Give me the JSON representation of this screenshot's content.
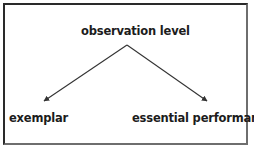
{
  "figure": {
    "background_color": "#ffffff",
    "frame_color_dark": "#2a2a2a",
    "frame_color_light": "#6e6e6e",
    "stroke_color": "#333333",
    "text_color": "#1c1c1c"
  },
  "nodes": {
    "root": {
      "label": "observation level"
    },
    "left_child": {
      "label": "exemplar"
    },
    "right_child": {
      "label": "essential performance"
    }
  },
  "edges": [
    {
      "name": "observation-level-to-exemplar",
      "from": "observation level",
      "to": "exemplar",
      "style": "solid",
      "arrowhead": "filled-triangle",
      "x1": 127,
      "y1": 45,
      "x2": 41,
      "y2": 103
    },
    {
      "name": "observation-level-to-essential-performance",
      "from": "observation level",
      "to": "essential performance",
      "style": "solid",
      "arrowhead": "filled-triangle",
      "x1": 127,
      "y1": 45,
      "x2": 210,
      "y2": 103
    }
  ]
}
